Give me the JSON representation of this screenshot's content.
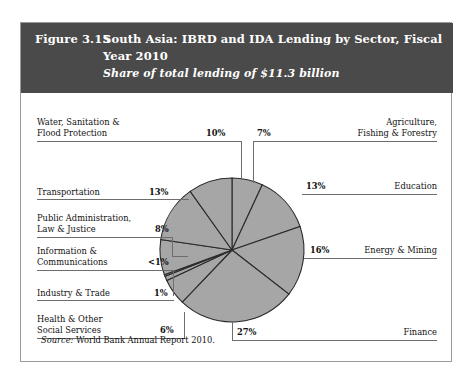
{
  "header": {
    "figure_number": "Figure 3.15",
    "title_line1": "South Asia: IBRD and IDA Lending by Sector, Fiscal",
    "title_line2": "Year 2010",
    "subtitle": "Share of total lending of $11.3 billion",
    "background_color": "#4a4a4a",
    "text_color": "#ffffff"
  },
  "source": {
    "prefix": "Source:",
    "text": "World Bank Annual Report 2010."
  },
  "chart_data": {
    "type": "pie",
    "title": "South Asia: IBRD and IDA Lending by Sector, Fiscal Year 2010",
    "subtitle": "Share of total lending of $11.3 billion",
    "total_label": "$11.3 billion",
    "slice_color": "#a6a6a6",
    "slice_border_color": "#2b2b2b",
    "start_angle_deg": 0,
    "direction": "clockwise",
    "categories": [
      "Agriculture, Fishing & Forestry",
      "Education",
      "Energy & Mining",
      "Finance",
      "Health & Other Social Services",
      "Industry & Trade",
      "Information & Communications",
      "Public Administration, Law & Justice",
      "Transportation",
      "Water, Sanitation & Flood Protection"
    ],
    "values": [
      7,
      13,
      16,
      27,
      6,
      1,
      0.4,
      8,
      13,
      10
    ],
    "value_labels": [
      "7%",
      "13%",
      "16%",
      "27%",
      "6%",
      "1%",
      "<1%",
      "8%",
      "13%",
      "10%"
    ],
    "units": "percent of total lending"
  },
  "callouts": {
    "water": {
      "line1": "Water, Sanitation &",
      "line2": "Flood Protection",
      "pct": "10%"
    },
    "transportation": {
      "line1": "Transportation",
      "line2": "",
      "pct": "13%"
    },
    "public_admin": {
      "line1": "Public Administration,",
      "line2": "Law & Justice",
      "pct": "8%"
    },
    "information": {
      "line1": "Information &",
      "line2": "Communications",
      "pct": "<1%"
    },
    "industry": {
      "line1": "Industry & Trade",
      "line2": "",
      "pct": "1%"
    },
    "health": {
      "line1": "Health & Other",
      "line2": "Social Services",
      "pct": "6%"
    },
    "agriculture": {
      "line1": "Agriculture,",
      "line2": "Fishing & Forestry",
      "pct": "7%"
    },
    "education": {
      "line1": "Education",
      "line2": "",
      "pct": "13%"
    },
    "energy": {
      "line1": "Energy & Mining",
      "line2": "",
      "pct": "16%"
    },
    "finance": {
      "line1": "Finance",
      "line2": "",
      "pct": "27%"
    }
  }
}
